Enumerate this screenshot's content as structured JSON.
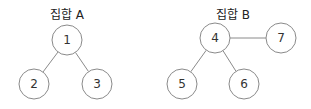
{
  "diagram": {
    "sets": [
      {
        "title": "집합 A",
        "title_pos": [
          67,
          8
        ],
        "nodes": [
          {
            "label": "1",
            "cx": 67,
            "cy": 40
          },
          {
            "label": "2",
            "cx": 34,
            "cy": 84
          },
          {
            "label": "3",
            "cx": 97,
            "cy": 84
          }
        ],
        "edges": [
          [
            0,
            1
          ],
          [
            0,
            2
          ]
        ]
      },
      {
        "title": "집합 B",
        "title_pos": [
          233,
          8
        ],
        "nodes": [
          {
            "label": "4",
            "cx": 215,
            "cy": 38
          },
          {
            "label": "5",
            "cx": 182,
            "cy": 84
          },
          {
            "label": "6",
            "cx": 244,
            "cy": 84
          },
          {
            "label": "7",
            "cx": 281,
            "cy": 38
          }
        ],
        "edges": [
          [
            0,
            1
          ],
          [
            0,
            2
          ],
          [
            0,
            3
          ]
        ]
      }
    ],
    "node_radius": 15,
    "stroke_color": "#8a8a8a",
    "fill_color": "#ffffff"
  }
}
